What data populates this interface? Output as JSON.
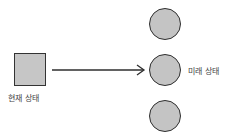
{
  "diagram": {
    "source": {
      "shape": "square",
      "label": "현재 상태",
      "fill": "#c6c6c6"
    },
    "arrow": {
      "from": "source",
      "to": "targets.1"
    },
    "targets": [
      {
        "shape": "circle",
        "fill": "#c4c4c4",
        "label": ""
      },
      {
        "shape": "circle",
        "fill": "#c4c4c4",
        "label": "미래 상태"
      },
      {
        "shape": "circle",
        "fill": "#c4c4c4",
        "label": ""
      }
    ],
    "colors": {
      "stroke": "#2e2e2e",
      "text": "#444444"
    }
  }
}
